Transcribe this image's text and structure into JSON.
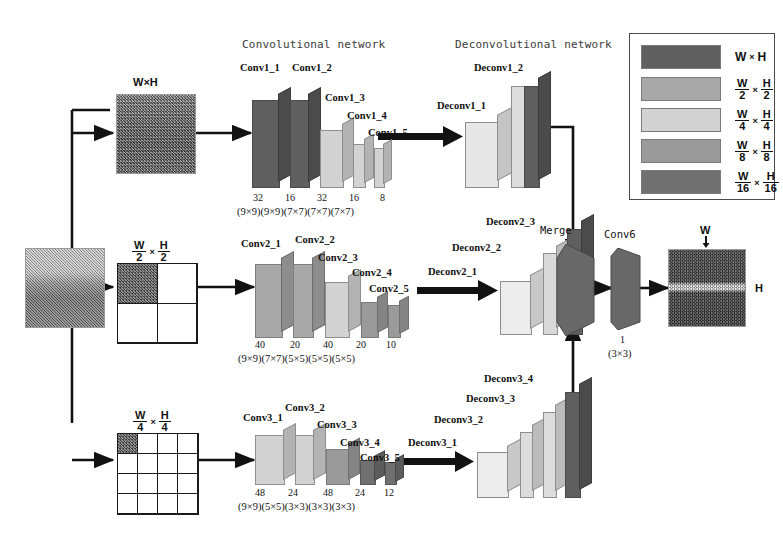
{
  "figure": {
    "sections": {
      "conv_network": "Convolutional network",
      "deconv_network": "Deconvolutional network"
    },
    "merge_label": "Merge",
    "conv6_label": "Conv6",
    "conv6_filters": "1",
    "conv6_kernel": "(3×3)"
  },
  "inputs": {
    "source_caption": "",
    "branches": [
      {
        "scale_label": "W×H",
        "scale_type": "plain",
        "grid": 1,
        "filled_cells": 1
      },
      {
        "scale_label": "W/2 × H/2",
        "scale_type": "frac",
        "num_w": "W",
        "den_w": "2",
        "num_h": "H",
        "den_h": "2",
        "grid": 2,
        "filled_cells": 1
      },
      {
        "scale_label": "W/4 × H/4",
        "scale_type": "frac",
        "num_w": "W",
        "den_w": "4",
        "num_h": "H",
        "den_h": "4",
        "grid": 4,
        "filled_cells": 1
      }
    ]
  },
  "output": {
    "width_label": "W",
    "height_label": "H"
  },
  "legend": {
    "items": [
      {
        "label": "W×H",
        "type": "plain",
        "num_w": "W",
        "den_w": "",
        "num_h": "H",
        "den_h": "",
        "color": "#5f5f5f"
      },
      {
        "label": "W/2 × H/2",
        "type": "frac",
        "num_w": "W",
        "den_w": "2",
        "num_h": "H",
        "den_h": "2",
        "color": "#a8a8a8"
      },
      {
        "label": "W/4 × H/4",
        "type": "frac",
        "num_w": "W",
        "den_w": "4",
        "num_h": "H",
        "den_h": "4",
        "color": "#d2d2d2"
      },
      {
        "label": "W/8 × H/8",
        "type": "frac",
        "num_w": "W",
        "den_w": "8",
        "num_h": "H",
        "den_h": "8",
        "color": "#9a9a9a"
      },
      {
        "label": "W/16 × H/16",
        "type": "frac",
        "num_w": "W",
        "den_w": "16",
        "num_h": "H",
        "den_h": "16",
        "color": "#707070"
      }
    ]
  },
  "branches": [
    {
      "id": "branch1",
      "conv_labels": [
        "Conv1_1",
        "Conv1_2",
        "Conv1_3",
        "Conv1_4",
        "Conv1_5"
      ],
      "filters": [
        "32",
        "16",
        "32",
        "16",
        "8"
      ],
      "kernels": [
        "(9×9)",
        "(9×9)",
        "(7×7)",
        "(7×7)",
        "(7×7)"
      ],
      "kernel_line": "(9×9)(9×9)(7×7)(7×7)(7×7)",
      "filters_line": "32   16   32   16   8",
      "deconv_labels": [
        "Deconv1_1",
        "Deconv1_2"
      ]
    },
    {
      "id": "branch2",
      "conv_labels": [
        "Conv2_1",
        "Conv2_2",
        "Conv2_3",
        "Conv2_4",
        "Conv2_5"
      ],
      "filters": [
        "40",
        "20",
        "40",
        "20",
        "10"
      ],
      "kernels": [
        "(9×9)",
        "(7×7)",
        "(5×5)",
        "(5×5)",
        "(5×5)"
      ],
      "kernel_line": "(9×9)(7×7)(5×5)(5×5)(5×5)",
      "filters_line": "40   20   40   20   10",
      "deconv_labels": [
        "Deconv2_1",
        "Deconv2_2",
        "Deconv2_3"
      ]
    },
    {
      "id": "branch3",
      "conv_labels": [
        "Conv3_1",
        "Conv3_2",
        "Conv3_3",
        "Conv3_4",
        "Conv3_5"
      ],
      "filters": [
        "48",
        "24",
        "48",
        "24",
        "12"
      ],
      "kernels": [
        "(9×9)",
        "(5×5)",
        "(3×3)",
        "(3×3)",
        "(3×3)"
      ],
      "kernel_line": "(9×9)(5×5)(3×3)(3×3)(3×3)",
      "filters_line": "48   24   48   24   12",
      "deconv_labels": [
        "Deconv3_1",
        "Deconv3_2",
        "Deconv3_3",
        "Deconv3_4"
      ]
    }
  ],
  "colors": {
    "scale_1": "#5f5f5f",
    "scale_2": "#a8a8a8",
    "scale_4": "#d2d2d2",
    "scale_8": "#9a9a9a",
    "scale_16": "#707070",
    "arrow": "#121212",
    "merge": "#686868",
    "conv6": "#686868"
  }
}
